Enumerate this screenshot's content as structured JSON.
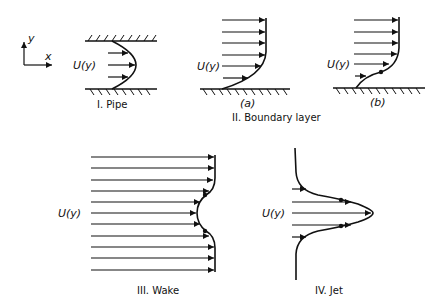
{
  "axes": {
    "x_label": "x",
    "y_label": "y"
  },
  "velocity_label": "U(y)",
  "panels": {
    "pipe": {
      "title": "I. Pipe"
    },
    "boundary_layer": {
      "title": "II. Boundary layer",
      "sub_a": "(a)",
      "sub_b": "(b)"
    },
    "wake": {
      "title": "III. Wake"
    },
    "jet": {
      "title": "IV. Jet"
    }
  },
  "colors": {
    "ink": "#111111",
    "background": "#ffffff"
  }
}
